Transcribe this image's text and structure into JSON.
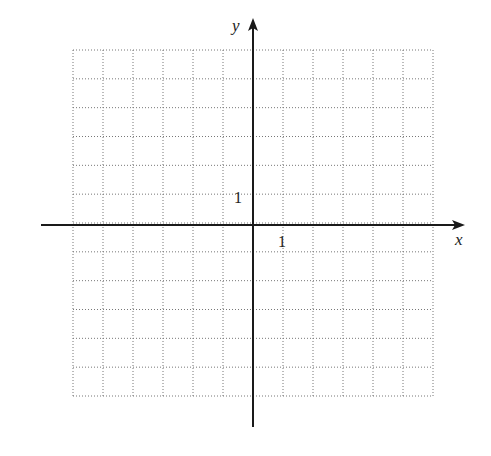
{
  "diagram": {
    "type": "coordinate-grid",
    "grid": {
      "columns": 12,
      "rows": 12,
      "x_range": [
        -6,
        6
      ],
      "y_range": [
        -6,
        6
      ],
      "line_style": "dotted",
      "line_color": "#777777"
    },
    "axes": {
      "x_label": "x",
      "y_label": "y",
      "color": "#1a1a1a",
      "arrows": "positive-ends"
    },
    "tick_labels": {
      "x_unit": "1",
      "y_unit": "1"
    }
  },
  "chart_data": {
    "type": "scatter",
    "title": "",
    "xlabel": "x",
    "ylabel": "y",
    "xlim": [
      -6,
      6
    ],
    "ylim": [
      -6,
      6
    ],
    "grid": true,
    "tick_labels": {
      "x": [
        "1"
      ],
      "y": [
        "1"
      ]
    },
    "series": []
  }
}
